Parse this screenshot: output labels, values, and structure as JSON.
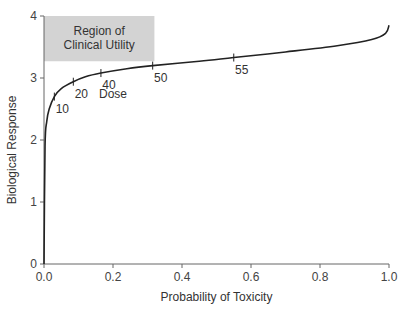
{
  "chart_data": {
    "type": "line",
    "title": "",
    "xlabel": "Probability of Toxicity",
    "ylabel": "Biological Response",
    "xlim": [
      0,
      1.0
    ],
    "ylim": [
      0,
      4
    ],
    "xticks": [
      "0.0",
      "0.2",
      "0.4",
      "0.6",
      "0.8",
      "1.0"
    ],
    "yticks": [
      "0",
      "1",
      "2",
      "3",
      "4"
    ],
    "grid": false,
    "legend": null,
    "series": [
      {
        "name": "Dose-response curve",
        "x": [
          0.0,
          0.003,
          0.008,
          0.015,
          0.03,
          0.05,
          0.085,
          0.12,
          0.165,
          0.24,
          0.315,
          0.45,
          0.55,
          0.7,
          0.85,
          0.95,
          0.99,
          1.0
        ],
        "y": [
          0.0,
          1.9,
          2.3,
          2.5,
          2.7,
          2.83,
          2.94,
          3.02,
          3.08,
          3.15,
          3.2,
          3.27,
          3.33,
          3.42,
          3.52,
          3.62,
          3.72,
          3.85
        ]
      }
    ],
    "dose_markers": [
      {
        "label": "10",
        "x": 0.03,
        "y": 2.7
      },
      {
        "label": "20",
        "x": 0.085,
        "y": 2.94
      },
      {
        "label": "40",
        "x": 0.165,
        "y": 3.08
      },
      {
        "label": "50",
        "x": 0.315,
        "y": 3.2
      },
      {
        "label": "55",
        "x": 0.55,
        "y": 3.33
      }
    ],
    "annotations": [
      {
        "text": "Dose",
        "x": 0.2,
        "y": 2.75
      }
    ],
    "shaded_region": {
      "label_line1": "Region of",
      "label_line2": "Clinical Utility",
      "x0": 0.0,
      "x1": 0.32,
      "y0": 3.27,
      "y1": 4.0,
      "color": "#d3d3d3"
    }
  },
  "colors": {
    "curve": "#222222",
    "axis": "#666666",
    "region": "#d3d3d3"
  }
}
